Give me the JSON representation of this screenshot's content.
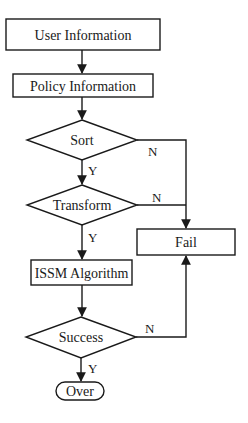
{
  "diagram": {
    "type": "flowchart",
    "nodes": {
      "user_info": {
        "label": "User Information",
        "shape": "rectangle"
      },
      "policy_info": {
        "label": "Policy Information",
        "shape": "rectangle"
      },
      "sort": {
        "label": "Sort",
        "shape": "diamond"
      },
      "transform": {
        "label": "Transform",
        "shape": "diamond"
      },
      "issm": {
        "label": "ISSM Algorithm",
        "shape": "rectangle"
      },
      "success": {
        "label": "Success",
        "shape": "diamond"
      },
      "over": {
        "label": "Over",
        "shape": "terminator"
      },
      "fail": {
        "label": "Fail",
        "shape": "rectangle"
      }
    },
    "edges": [
      {
        "from": "user_info",
        "to": "policy_info",
        "label": ""
      },
      {
        "from": "policy_info",
        "to": "sort",
        "label": ""
      },
      {
        "from": "sort",
        "to": "transform",
        "label": "Y"
      },
      {
        "from": "sort",
        "to": "fail",
        "label": "N"
      },
      {
        "from": "transform",
        "to": "issm",
        "label": "Y"
      },
      {
        "from": "transform",
        "to": "fail",
        "label": "N"
      },
      {
        "from": "issm",
        "to": "success",
        "label": ""
      },
      {
        "from": "success",
        "to": "over",
        "label": "Y"
      },
      {
        "from": "success",
        "to": "fail",
        "label": "N"
      }
    ],
    "labels": {
      "yes": "Y",
      "no": "N"
    }
  }
}
